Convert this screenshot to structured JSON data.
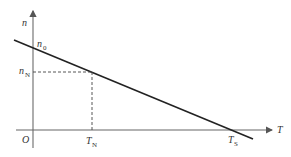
{
  "diagram": {
    "type": "speed-torque characteristic",
    "axes": {
      "y_label": "n",
      "x_label": "T",
      "origin_label": "O"
    },
    "points": {
      "n0": {
        "label": "n",
        "subscript": "0"
      },
      "nN": {
        "label": "n",
        "subscript": "N"
      },
      "TN": {
        "label": "T",
        "subscript": "N"
      },
      "TS": {
        "label": "T",
        "subscript": "S"
      }
    },
    "colors": {
      "axis": "#555555",
      "line": "#222222",
      "dashed": "#444444",
      "text": "#333333"
    }
  }
}
